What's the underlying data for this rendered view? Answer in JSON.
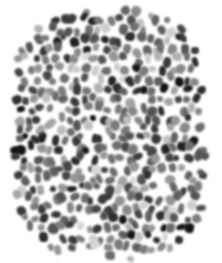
{
  "image": {
    "title": "Grayscale blob field texture",
    "width": 222,
    "height": 263,
    "background_color": "#ffffff",
    "content_type": "abstract-texture",
    "description": "Dense scattered field of small irregular grayscale blob marks on a white background"
  },
  "blob_field": {
    "name": "grayscale-blob-field",
    "approximate_count": 430,
    "bounds": {
      "left": 13,
      "top": 10,
      "right": 207,
      "bottom": 257
    },
    "edge_style": "irregular-ragged",
    "arrangement": "jittered-quasi-grid",
    "pitch_x": 9.4,
    "pitch_y": 9.9,
    "jitter_x": 3.2,
    "jitter_y": 3.4,
    "blob_width_min": 5.5,
    "blob_width_max": 10.5,
    "blob_height_min": 6.0,
    "blob_height_max": 11.5,
    "edge_softness_px": 1.05,
    "rotation_range_deg": 70,
    "fill_probability": 0.93,
    "palette": [
      "#141414",
      "#222222",
      "#2e2e2e",
      "#3a3a3a",
      "#474747",
      "#545454",
      "#616161",
      "#6e6e6e",
      "#7b7b7b",
      "#888888",
      "#969696",
      "#a4a4a4",
      "#b2b2b2",
      "#c0c0c0",
      "#cecece",
      "#d8d8d8"
    ],
    "palette_weights": [
      4,
      6,
      7,
      8,
      9,
      10,
      10,
      10,
      9,
      8,
      7,
      6,
      5,
      4,
      3,
      2
    ],
    "darkest_color": "#141414",
    "lightest_color": "#d8d8d8",
    "seed": 20240917
  }
}
